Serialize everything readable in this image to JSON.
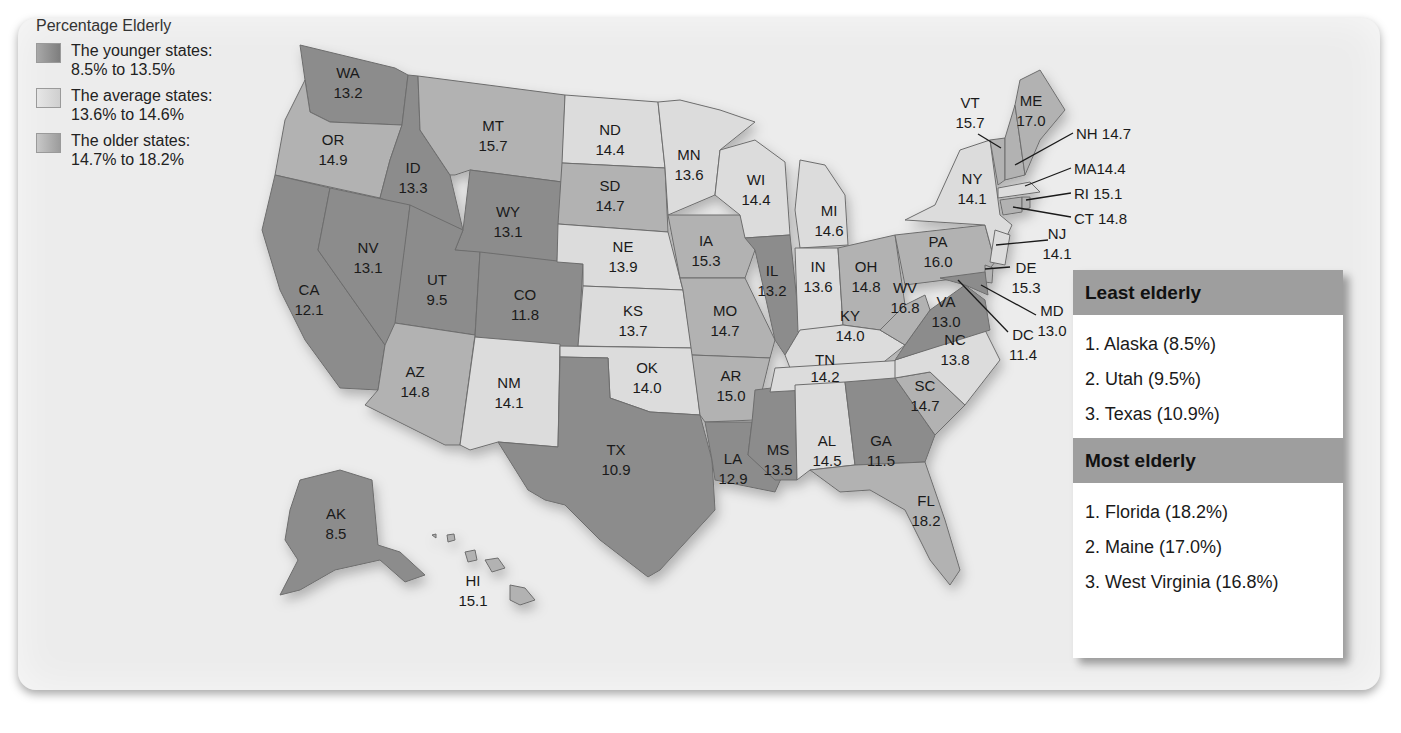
{
  "legend": {
    "title": "Percentage Elderly",
    "items": [
      {
        "line1": "The younger states:",
        "line2": "8.5% to 13.5%",
        "color": "#8c8c8c"
      },
      {
        "line1": "The average states:",
        "line2": "13.6% to 14.6%",
        "color": "#dcdcdc"
      },
      {
        "line1": "The older states:",
        "line2": "14.7% to 18.2%",
        "color": "#b2b2b2"
      }
    ]
  },
  "states": {
    "WA": {
      "abbr": "WA",
      "value": "13.2"
    },
    "OR": {
      "abbr": "OR",
      "value": "14.9"
    },
    "CA": {
      "abbr": "CA",
      "value": "12.1"
    },
    "ID": {
      "abbr": "ID",
      "value": "13.3"
    },
    "NV": {
      "abbr": "NV",
      "value": "13.1"
    },
    "MT": {
      "abbr": "MT",
      "value": "15.7"
    },
    "WY": {
      "abbr": "WY",
      "value": "13.1"
    },
    "UT": {
      "abbr": "UT",
      "value": "9.5"
    },
    "CO": {
      "abbr": "CO",
      "value": "11.8"
    },
    "AZ": {
      "abbr": "AZ",
      "value": "14.8"
    },
    "NM": {
      "abbr": "NM",
      "value": "14.1"
    },
    "ND": {
      "abbr": "ND",
      "value": "14.4"
    },
    "SD": {
      "abbr": "SD",
      "value": "14.7"
    },
    "NE": {
      "abbr": "NE",
      "value": "13.9"
    },
    "KS": {
      "abbr": "KS",
      "value": "13.7"
    },
    "OK": {
      "abbr": "OK",
      "value": "14.0"
    },
    "TX": {
      "abbr": "TX",
      "value": "10.9"
    },
    "MN": {
      "abbr": "MN",
      "value": "13.6"
    },
    "IA": {
      "abbr": "IA",
      "value": "15.3"
    },
    "MO": {
      "abbr": "MO",
      "value": "14.7"
    },
    "AR": {
      "abbr": "AR",
      "value": "15.0"
    },
    "LA": {
      "abbr": "LA",
      "value": "12.9"
    },
    "WI": {
      "abbr": "WI",
      "value": "14.4"
    },
    "IL": {
      "abbr": "IL",
      "value": "13.2"
    },
    "MS": {
      "abbr": "MS",
      "value": "13.5"
    },
    "MI": {
      "abbr": "MI",
      "value": "14.6"
    },
    "IN": {
      "abbr": "IN",
      "value": "13.6"
    },
    "OH": {
      "abbr": "OH",
      "value": "14.8"
    },
    "KY": {
      "abbr": "KY",
      "value": "14.0"
    },
    "TN": {
      "abbr": "TN",
      "value": "14.2"
    },
    "AL": {
      "abbr": "AL",
      "value": "14.5"
    },
    "GA": {
      "abbr": "GA",
      "value": "11.5"
    },
    "FL": {
      "abbr": "FL",
      "value": "18.2"
    },
    "SC": {
      "abbr": "SC",
      "value": "14.7"
    },
    "NC": {
      "abbr": "NC",
      "value": "13.8"
    },
    "VA": {
      "abbr": "VA",
      "value": "13.0"
    },
    "WV": {
      "abbr": "WV",
      "value": "16.8"
    },
    "PA": {
      "abbr": "PA",
      "value": "16.0"
    },
    "NY": {
      "abbr": "NY",
      "value": "14.1"
    },
    "VT": {
      "abbr": "VT",
      "value": "15.7"
    },
    "ME": {
      "abbr": "ME",
      "value": "17.0"
    },
    "NH": {
      "label": "NH 14.7"
    },
    "MA": {
      "label": "MA14.4"
    },
    "RI": {
      "label": "RI 15.1"
    },
    "CT": {
      "label": "CT 14.8"
    },
    "NJ": {
      "abbr": "NJ",
      "value": "14.1"
    },
    "DE": {
      "abbr": "DE",
      "value": "15.3"
    },
    "MD": {
      "abbr": "MD",
      "value": "13.0"
    },
    "DC": {
      "abbr": "DC",
      "value": "11.4"
    },
    "AK": {
      "abbr": "AK",
      "value": "8.5"
    },
    "HI": {
      "abbr": "HI",
      "value": "15.1"
    }
  },
  "rankings": {
    "least": {
      "title": "Least elderly",
      "items": [
        "1.  Alaska (8.5%)",
        "2.  Utah (9.5%)",
        "3.  Texas (10.9%)"
      ]
    },
    "most": {
      "title": "Most elderly",
      "items": [
        "1.  Florida (18.2%)",
        "2.  Maine (17.0%)",
        "3.  West Virginia (16.8%)"
      ]
    }
  },
  "colors": {
    "younger": "#8c8c8c",
    "average": "#dcdcdc",
    "older": "#b2b2b2",
    "panel": "#ececec",
    "header": "#9e9e9e"
  }
}
